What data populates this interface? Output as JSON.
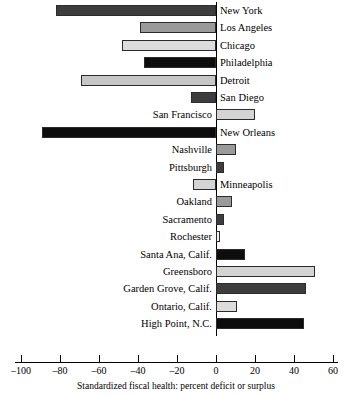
{
  "chart_data": {
    "type": "bar",
    "orientation": "horizontal",
    "title": "",
    "subtitle": "",
    "xlabel": "Standardized fiscal health: percent deficit or surplus",
    "ylabel": "",
    "xlim": [
      -105,
      65
    ],
    "xticks": [
      -100,
      -80,
      -60,
      -40,
      -20,
      0,
      20,
      40,
      60
    ],
    "xtick_labels": [
      "–100",
      "–80",
      "–60",
      "–40",
      "–20",
      "0",
      "20",
      "40",
      "60"
    ],
    "grid": false,
    "legend": "none",
    "categories": [
      "New York",
      "Los Angeles",
      "Chicago",
      "Philadelphia",
      "Detroit",
      "San Diego",
      "San Francisco",
      "New Orleans",
      "Nashville",
      "Pittsburgh",
      "Minneapolis",
      "Oakland",
      "Sacramento",
      "Rochester",
      "Santa Ana, Calif.",
      "Greensboro",
      "Garden Grove, Calif.",
      "Ontario, Calif.",
      "High Point, N.C."
    ],
    "values": [
      -82,
      -39,
      -48,
      -37,
      -69,
      -13,
      20,
      -89,
      10,
      4,
      -12,
      8,
      4,
      2,
      15,
      51,
      46,
      11,
      45
    ],
    "bar_fills": [
      "#3d3d3d",
      "#9a9a9a",
      "#dcdcdc",
      "#0d0d0d",
      "#c6c6c6",
      "#3d3d3d",
      "#d4d4d4",
      "#0d0d0d",
      "#9a9a9a",
      "#3d3d3d",
      "#d4d4d4",
      "#9a9a9a",
      "#3d3d3d",
      "#f4f4f4",
      "#0d0d0d",
      "#d4d4d4",
      "#3d3d3d",
      "#dcdcdc",
      "#0d0d0d"
    ],
    "bar_outline_color": "#2b2b2b",
    "background_color": "#ffffff",
    "axis_color": "#000000"
  }
}
